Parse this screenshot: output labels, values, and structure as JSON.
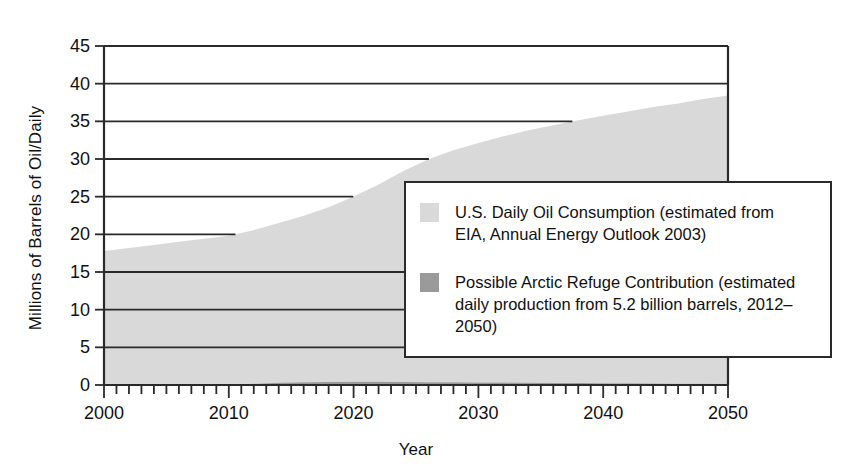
{
  "chart_data": {
    "type": "area",
    "title": "",
    "subtitle": "",
    "xlabel": "Year",
    "ylabel": "Millions of Barrels of Oil/Daily",
    "xlim": [
      2000,
      2050
    ],
    "ylim": [
      0,
      45
    ],
    "grid": true,
    "grid_axis": "y",
    "stacked": true,
    "legend_position": "inside-right",
    "y_ticks": [
      0,
      5,
      10,
      15,
      20,
      25,
      30,
      35,
      40,
      45
    ],
    "y_tick_labels": [
      "0",
      "5",
      "10",
      "15",
      "20",
      "25",
      "30",
      "35",
      "40",
      "45"
    ],
    "x_ticks": [
      2000,
      2010,
      2020,
      2030,
      2040,
      2050
    ],
    "x_tick_labels": [
      "2000",
      "2010",
      "2020",
      "2030",
      "2040",
      "2050"
    ],
    "x_minor_tick_interval": 1,
    "x": [
      2000,
      2002,
      2004,
      2006,
      2008,
      2010,
      2012,
      2014,
      2016,
      2018,
      2020,
      2022,
      2024,
      2026,
      2028,
      2030,
      2032,
      2034,
      2036,
      2038,
      2040,
      2042,
      2044,
      2046,
      2048,
      2050
    ],
    "series": [
      {
        "name": "Possible Arctic Refuge Contribution",
        "color": "#9a9a9a",
        "values": [
          0,
          0,
          0,
          0,
          0,
          0,
          0.15,
          0.3,
          0.36,
          0.4,
          0.42,
          0.42,
          0.4,
          0.38,
          0.36,
          0.34,
          0.32,
          0.3,
          0.28,
          0.26,
          0.24,
          0.22,
          0.2,
          0.18,
          0.16,
          0.14
        ]
      },
      {
        "name": "U.S. Daily Oil Consumption",
        "color": "#d9d9d9",
        "values": [
          17.8,
          18.2,
          18.6,
          19.0,
          19.4,
          19.8,
          20.4,
          21.2,
          22.1,
          23.2,
          24.6,
          26.2,
          28.0,
          29.6,
          30.8,
          31.8,
          32.7,
          33.5,
          34.2,
          34.9,
          35.5,
          36.1,
          36.7,
          37.2,
          37.8,
          38.3
        ]
      }
    ],
    "legend": [
      {
        "swatch_color": "#d9d9d9",
        "label": "U.S. Daily Oil Consumption (estimated from EIA, Annual Energy Outlook 2003)"
      },
      {
        "swatch_color": "#9a9a9a",
        "label": "Possible Arctic Refuge Contribution (estimated daily production from 5.2 billion barrels, 2012–2050)"
      }
    ]
  },
  "axes": {
    "y_title": "Millions of Barrels of Oil/Daily",
    "x_title": "Year",
    "y_labels": [
      "45",
      "40",
      "35",
      "30",
      "25",
      "20",
      "15",
      "10",
      "5",
      "0"
    ],
    "x_labels": [
      "2000",
      "2010",
      "2020",
      "2030",
      "2040",
      "2050"
    ]
  },
  "legend": {
    "item1_label": "U.S. Daily Oil Consumption (estimated from EIA, Annual Energy Outlook 2003)",
    "item2_label": "Possible Arctic Refuge Contribution (estimated daily production from 5.2 billion barrels, 2012–2050)"
  },
  "colors": {
    "consumption_fill": "#d9d9d9",
    "arctic_fill": "#9a9a9a",
    "axis": "#2a2a2a",
    "gridline": "#2a2a2a",
    "background": "#ffffff"
  }
}
